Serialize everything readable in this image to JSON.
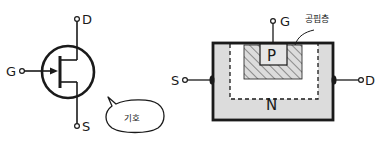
{
  "symbol": {
    "terminals": {
      "drain": "D",
      "gate": "G",
      "source": "S"
    },
    "speech_bubble": "기호"
  },
  "structure": {
    "terminals": {
      "gate": "G",
      "source": "S",
      "drain": "D"
    },
    "p_region": "P",
    "n_region": "N",
    "depletion_label": "공핍층"
  },
  "colors": {
    "ink": "#1a1a1a",
    "substrate_fill": "#dcdcdc",
    "inner_fill": "#ffffff",
    "hatch": "#555555",
    "p_fill": "#e6e6e6"
  }
}
